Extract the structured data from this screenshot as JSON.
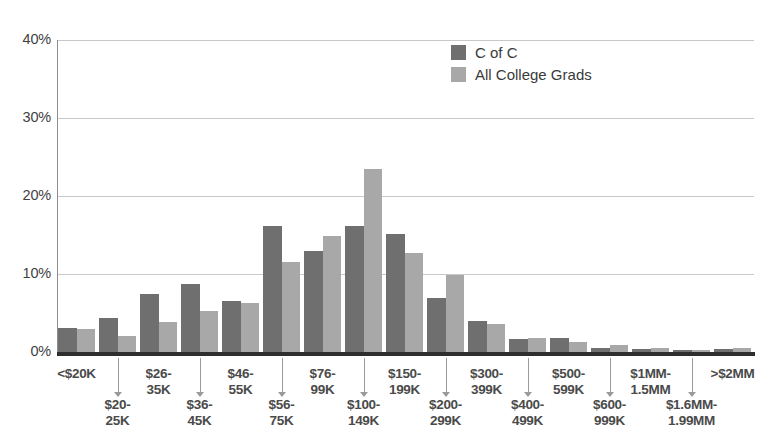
{
  "chart_data": {
    "type": "bar",
    "title": "",
    "xlabel": "",
    "ylabel": "",
    "ylim": [
      0,
      40
    ],
    "grid": true,
    "legend_position": "top-right",
    "ytick_labels": [
      "40%",
      "30%",
      "20%",
      "10%",
      "0%"
    ],
    "ytick_values": [
      40,
      30,
      20,
      10,
      0
    ],
    "categories": [
      "<$20K",
      "$20-25K",
      "$26-35K",
      "$36-45K",
      "$46-55K",
      "$56-75K",
      "$76-99K",
      "$100-149K",
      "$150-199K",
      "$200-299K",
      "$300-399K",
      "$400-499K",
      "$500-599K",
      "$600-999K",
      "$1MM-1.5MM",
      "$1.6MM-1.99MM",
      ">$2MM"
    ],
    "category_labels": [
      {
        "line1": "<$20K",
        "line2": "",
        "row": "top"
      },
      {
        "line1": "$20-",
        "line2": "25K",
        "row": "bottom"
      },
      {
        "line1": "$26-",
        "line2": "35K",
        "row": "top"
      },
      {
        "line1": "$36-",
        "line2": "45K",
        "row": "bottom"
      },
      {
        "line1": "$46-",
        "line2": "55K",
        "row": "top"
      },
      {
        "line1": "$56-",
        "line2": "75K",
        "row": "bottom"
      },
      {
        "line1": "$76-",
        "line2": "99K",
        "row": "top"
      },
      {
        "line1": "$100-",
        "line2": "149K",
        "row": "bottom"
      },
      {
        "line1": "$150-",
        "line2": "199K",
        "row": "top"
      },
      {
        "line1": "$200-",
        "line2": "299K",
        "row": "bottom"
      },
      {
        "line1": "$300-",
        "line2": "399K",
        "row": "top"
      },
      {
        "line1": "$400-",
        "line2": "499K",
        "row": "bottom"
      },
      {
        "line1": "$500-",
        "line2": "599K",
        "row": "top"
      },
      {
        "line1": "$600-",
        "line2": "999K",
        "row": "bottom"
      },
      {
        "line1": "$1MM-",
        "line2": "1.5MM",
        "row": "top"
      },
      {
        "line1": "$1.6MM-",
        "line2": "1.99MM",
        "row": "bottom"
      },
      {
        "line1": ">$2MM",
        "line2": "",
        "row": "top"
      }
    ],
    "series": [
      {
        "name": "C of C",
        "color": "#6f6f6f",
        "values": [
          3.1,
          4.3,
          7.5,
          8.7,
          6.6,
          16.1,
          12.9,
          16.2,
          15.1,
          6.9,
          4.0,
          1.7,
          1.8,
          0.5,
          0.4,
          0.2,
          0.4
        ]
      },
      {
        "name": "All College Grads",
        "color": "#a8a8a8",
        "values": [
          3.0,
          2.0,
          3.9,
          5.3,
          6.3,
          11.5,
          14.9,
          23.4,
          12.7,
          9.9,
          3.6,
          1.8,
          1.3,
          0.9,
          0.5,
          0.3,
          0.5
        ]
      }
    ]
  },
  "legend": {
    "items": [
      {
        "label": "C of C",
        "color": "#6f6f6f"
      },
      {
        "label": "All College Grads",
        "color": "#a8a8a8"
      }
    ]
  },
  "axis": {
    "axis_color": "#2e2e2e",
    "grid_color": "#c9c9c9"
  }
}
